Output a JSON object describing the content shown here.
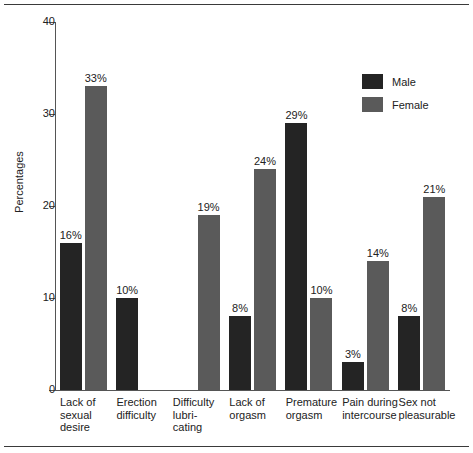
{
  "chart_data": {
    "type": "bar",
    "title": "",
    "subtitle": "",
    "xlabel": "",
    "ylabel": "Percentages",
    "ylim": [
      0,
      40
    ],
    "yticks": [
      0,
      10,
      20,
      30,
      40
    ],
    "grid": false,
    "legend_position": "top-right",
    "value_suffix": "%",
    "categories": [
      "Lack of sexual desire",
      "Erection difficulty",
      "Difficulty lubricating",
      "Lack of orgasm",
      "Premature orgasm",
      "Pain during intercourse",
      "Sex not pleasurable"
    ],
    "category_lines": [
      [
        "Lack of",
        "sexual",
        "desire"
      ],
      [
        "Erection",
        "difficulty"
      ],
      [
        "Difficulty",
        "lubri-",
        "cating"
      ],
      [
        "Lack of",
        "orgasm"
      ],
      [
        "Premature",
        "orgasm"
      ],
      [
        "Pain during",
        "intercourse"
      ],
      [
        "Sex not",
        "pleasurable"
      ]
    ],
    "series": [
      {
        "name": "Male",
        "color": "#242424",
        "values": [
          16,
          10,
          null,
          8,
          29,
          3,
          8
        ],
        "labels": [
          "16%",
          "10%",
          "",
          "8%",
          "29%",
          "3%",
          "8%"
        ]
      },
      {
        "name": "Female",
        "color": "#5a5a5a",
        "values": [
          33,
          null,
          19,
          24,
          10,
          14,
          21
        ],
        "labels": [
          "33%",
          "",
          "19%",
          "24%",
          "10%",
          "14%",
          "21%"
        ]
      }
    ]
  },
  "axis": {
    "tick_labels": [
      "40",
      "30",
      "20",
      "10",
      "0"
    ],
    "y_title": "Percentages"
  },
  "legend": {
    "items": [
      {
        "label": "Male",
        "color": "#242424"
      },
      {
        "label": "Female",
        "color": "#5a5a5a"
      }
    ]
  },
  "colors": {
    "male": "#242424",
    "female": "#5a5a5a",
    "axis": "#555555",
    "text": "#222222",
    "rule": "#3a3a3a",
    "background": "#ffffff"
  }
}
